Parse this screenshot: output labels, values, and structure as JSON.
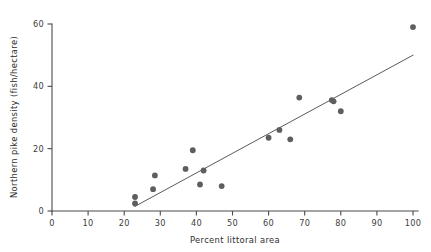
{
  "chart_data": {
    "type": "scatter",
    "title": "",
    "xlabel": "Percent littoral area",
    "ylabel": "Northern pike density (fish/hectare)",
    "xlim": [
      0,
      100
    ],
    "ylim": [
      0,
      60
    ],
    "xticks": [
      0,
      10,
      20,
      30,
      40,
      50,
      60,
      70,
      80,
      90,
      100
    ],
    "yticks": [
      0,
      20,
      40,
      60
    ],
    "xtick_labels": [
      "0",
      "10",
      "20",
      "30",
      "40",
      "50",
      "60",
      "70",
      "80",
      "90",
      "100"
    ],
    "ytick_labels": [
      "0",
      "20",
      "40",
      "60"
    ],
    "grid": false,
    "legend": false,
    "marker_color": "#5e5e5e",
    "line_color": "#5a5a5a",
    "axis_color": "#4a4a4a",
    "points": [
      {
        "x": 23.0,
        "y": 4.5
      },
      {
        "x": 23.0,
        "y": 2.4
      },
      {
        "x": 28.0,
        "y": 7.0
      },
      {
        "x": 28.5,
        "y": 11.4
      },
      {
        "x": 37.0,
        "y": 13.5
      },
      {
        "x": 39.0,
        "y": 19.5
      },
      {
        "x": 41.0,
        "y": 8.5
      },
      {
        "x": 42.0,
        "y": 13.0
      },
      {
        "x": 47.0,
        "y": 8.0
      },
      {
        "x": 60.0,
        "y": 23.5
      },
      {
        "x": 63.0,
        "y": 26.0
      },
      {
        "x": 66.0,
        "y": 23.0
      },
      {
        "x": 68.5,
        "y": 36.4
      },
      {
        "x": 77.5,
        "y": 35.6
      },
      {
        "x": 78.0,
        "y": 35.2
      },
      {
        "x": 80.0,
        "y": 32.0
      },
      {
        "x": 100.0,
        "y": 59.0
      }
    ],
    "trendline": {
      "x1": 23.0,
      "y1": 1.5,
      "x2": 100.0,
      "y2": 50.0
    }
  }
}
